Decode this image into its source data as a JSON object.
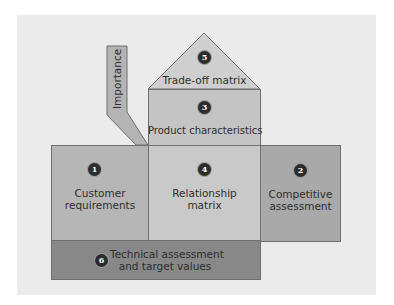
{
  "diagram": {
    "sections": [
      {
        "id": 1,
        "number": "1",
        "line1": "Customer",
        "line2": "requirements",
        "color": "#b6b6b6"
      },
      {
        "id": 2,
        "number": "2",
        "line1": "Competitive",
        "line2": "assessment",
        "color": "#a9a9a9"
      },
      {
        "id": 3,
        "number": "3",
        "label": "Product characteristics",
        "color": "#c4c4c4"
      },
      {
        "id": 4,
        "number": "4",
        "line1": "Relationship",
        "line2": "matrix",
        "color": "#c9c9c9"
      },
      {
        "id": 5,
        "number": "5",
        "label": "Trade-off matrix",
        "color": "#cfcfcf"
      },
      {
        "id": 6,
        "number": "6",
        "line1": "Technical assessment",
        "line2": "and target values",
        "color": "#888888"
      }
    ],
    "importance": {
      "label": "Importance",
      "color": "#b4b4b4"
    },
    "colors": {
      "background": "#ebebeb",
      "outline": "#6f6f6f",
      "circle": "#2c2c2c"
    }
  }
}
